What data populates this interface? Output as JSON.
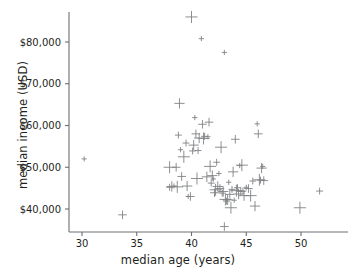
{
  "chart_data": {
    "type": "scatter",
    "title": "",
    "xlabel": "median age (years)",
    "ylabel": "median income (USD)",
    "xlim": [
      28.8,
      53.2
    ],
    "ylim": [
      34000,
      88500
    ],
    "grid": false,
    "legend": null,
    "marker": "plus",
    "marker_color": "#808285",
    "axis_color": "#6d6e71",
    "background": "#ffffff",
    "xticks": [
      30,
      35,
      40,
      45,
      50
    ],
    "xticklabels": [
      "30",
      "35",
      "40",
      "45",
      "50"
    ],
    "yticks": [
      40000,
      50000,
      60000,
      70000,
      80000
    ],
    "yticklabels": [
      "$40,000",
      "$50,000",
      "$60,000",
      "$70,000",
      "$80,000"
    ],
    "x": [
      30.2,
      33.7,
      38.0,
      38.0,
      38.2,
      38.4,
      38.6,
      38.7,
      38.8,
      38.9,
      39.0,
      39.1,
      39.3,
      39.5,
      39.6,
      39.7,
      39.9,
      40.0,
      40.1,
      40.2,
      40.3,
      40.4,
      40.5,
      40.6,
      40.7,
      40.9,
      41.0,
      41.1,
      41.2,
      41.4,
      41.5,
      41.6,
      41.7,
      41.8,
      41.9,
      42.0,
      42.1,
      42.2,
      42.3,
      42.4,
      42.5,
      42.6,
      42.7,
      42.8,
      42.9,
      43.0,
      43.0,
      43.1,
      43.2,
      43.3,
      43.4,
      43.5,
      43.6,
      43.7,
      43.8,
      43.9,
      44.0,
      44.1,
      44.2,
      44.3,
      44.4,
      44.5,
      44.6,
      44.7,
      44.8,
      45.0,
      45.2,
      45.4,
      45.6,
      45.8,
      46.0,
      46.1,
      46.2,
      46.3,
      46.4,
      46.5,
      46.6,
      49.9,
      51.7
    ],
    "y": [
      52000,
      38600,
      50000,
      45200,
      45400,
      45500,
      50000,
      45300,
      57700,
      65300,
      54200,
      47800,
      52500,
      55800,
      45500,
      43000,
      43000,
      86000,
      53900,
      55300,
      61900,
      58000,
      47300,
      54000,
      57000,
      80800,
      60300,
      56900,
      57400,
      47700,
      57300,
      60800,
      50200,
      46200,
      48000,
      47200,
      43900,
      44600,
      51200,
      45400,
      48500,
      44900,
      54800,
      43800,
      44200,
      77500,
      35800,
      42300,
      41900,
      42200,
      46400,
      43500,
      40300,
      44700,
      48900,
      42100,
      56700,
      44400,
      45100,
      43600,
      50400,
      44200,
      50500,
      44300,
      43200,
      45200,
      44900,
      43200,
      46700,
      40700,
      60400,
      58000,
      47000,
      46900,
      49800,
      50200,
      46800,
      40300,
      44300
    ]
  }
}
